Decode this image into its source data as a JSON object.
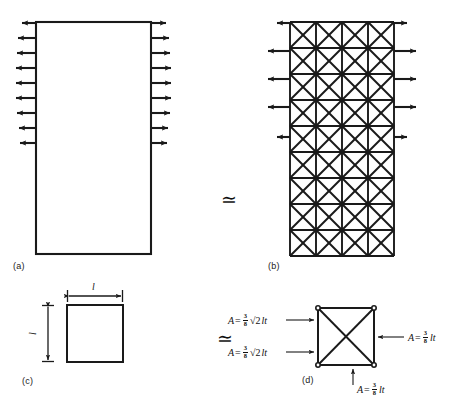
{
  "figure": {
    "type": "engineering-diagram",
    "stroke_color": "#1a1a1a",
    "background_color": "#ffffff"
  },
  "panels": [
    {
      "id": "a",
      "label": "(a)",
      "kind": "continuum-plate",
      "arrows_left": 9,
      "arrows_right": 9,
      "arrow_direction": "outward",
      "meaning": "solid rectangular plate loaded in uniform tension"
    },
    {
      "id": "b",
      "label": "(b)",
      "kind": "truss-lattice",
      "grid_columns": 4,
      "grid_rows": 9,
      "cell_bracing": "double-diagonal",
      "arrows_left": 5,
      "arrows_right": 5,
      "arrow_direction": "outward",
      "meaning": "equivalent pin-jointed X-braced truss"
    },
    {
      "id": "c",
      "label": "(c)",
      "kind": "unit-cell-dimensions",
      "width_label": "l",
      "height_label": "l",
      "meaning": "square unit cell of side l"
    },
    {
      "id": "d",
      "label": "(d)",
      "kind": "unit-cell-members",
      "meaning": "equivalent bar areas for the unit cell"
    }
  ],
  "equivalence_symbols": [
    {
      "name": "equiv-a-b",
      "glyph": "≃"
    },
    {
      "name": "equiv-c-d",
      "glyph": "≃"
    }
  ],
  "formulas": [
    {
      "id": "diagonal-upper",
      "target": "upper-left diagonal member",
      "lhs": "A",
      "relation": "=",
      "numerator": "3",
      "denominator": "8",
      "radical": "√2",
      "factor": "lt",
      "text": "A = 3/8 √2 lt"
    },
    {
      "id": "diagonal-lower",
      "target": "lower-left diagonal member",
      "lhs": "A",
      "relation": "=",
      "numerator": "3",
      "denominator": "8",
      "radical": "√2",
      "factor": "lt",
      "text": "A = 3/8 √2 lt"
    },
    {
      "id": "edge-right",
      "target": "right vertical edge member",
      "lhs": "A",
      "relation": "=",
      "numerator": "3",
      "denominator": "8",
      "radical": "",
      "factor": "lt",
      "text": "A = 3/8 lt"
    },
    {
      "id": "edge-bottom",
      "target": "bottom horizontal edge member",
      "lhs": "A",
      "relation": "=",
      "numerator": "3",
      "denominator": "8",
      "radical": "",
      "factor": "lt",
      "text": "A = 3/8 lt"
    }
  ]
}
